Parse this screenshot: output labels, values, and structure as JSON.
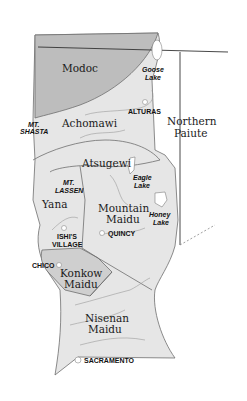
{
  "map": {
    "colors": {
      "background": "#ffffff",
      "region_fill": "#e6e6e6",
      "modoc_fill": "#bdbdbd",
      "konkow_fill": "#cfcfcf",
      "border": "#6e6e6e",
      "state_line": "#333333",
      "lake": "#ffffff"
    },
    "tribes": {
      "modoc": "Modoc",
      "achomawi": "Achomawi",
      "northern_paiute_1": "Northern",
      "northern_paiute_2": "Paiute",
      "atsugewi": "Atsugewi",
      "yana": "Yana",
      "mountain_maidu_1": "Mountain",
      "mountain_maidu_2": "Maidu",
      "konkow_maidu_1": "Konkow",
      "konkow_maidu_2": "Maidu",
      "nisenan_maidu_1": "Nisenan",
      "nisenan_maidu_2": "Maidu"
    },
    "places": {
      "goose_lake_1": "Goose",
      "goose_lake_2": "Lake",
      "alturas": "ALTURAS",
      "mt_shasta_1": "MT.",
      "mt_shasta_2": "SHASTA",
      "mt_lassen_1": "MT.",
      "mt_lassen_2": "LASSEN",
      "eagle_lake_1": "Eagle",
      "eagle_lake_2": "Lake",
      "honey_lake_1": "Honey",
      "honey_lake_2": "Lake",
      "ishis_village_1": "ISHI'S",
      "ishis_village_2": "VILLAGE",
      "quincy": "QUINCY",
      "chico": "CHICO",
      "sacramento": "SACRAMENTO"
    }
  }
}
